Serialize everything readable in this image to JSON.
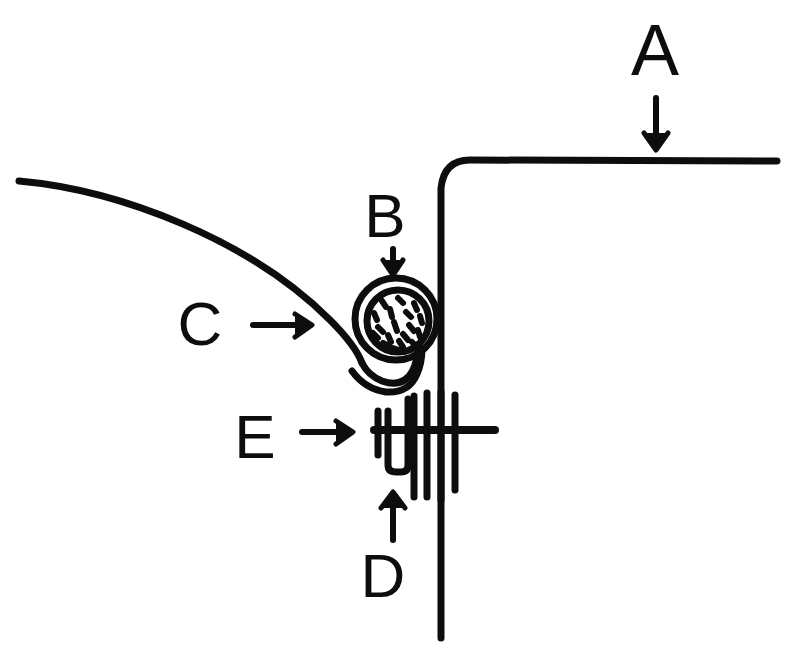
{
  "figure": {
    "background_color": "#ffffff",
    "ink_color": "#0d0d0d",
    "width": 790,
    "height": 659,
    "style": "black-and-white line drawing"
  },
  "labels": [
    {
      "id": "A",
      "text": "A",
      "arrow_direction": "down",
      "points_to": "upper horizontal surface line at right",
      "label_x": 655,
      "label_y": 75,
      "font_size": 72
    },
    {
      "id": "B",
      "text": "B",
      "arrow_direction": "down",
      "points_to": "stippled circular structure",
      "label_x": 385,
      "label_y": 237,
      "font_size": 62
    },
    {
      "id": "C",
      "text": "C",
      "arrow_direction": "right",
      "points_to": "descending curved line from upper left",
      "label_x": 200,
      "label_y": 345,
      "font_size": 62
    },
    {
      "id": "D",
      "text": "D",
      "arrow_direction": "up",
      "points_to": "vertical strand bundle",
      "label_x": 383,
      "label_y": 597,
      "font_size": 62
    },
    {
      "id": "E",
      "text": "E",
      "arrow_direction": "right",
      "points_to": "horizontal crossbar element",
      "label_x": 255,
      "label_y": 458,
      "font_size": 62
    }
  ],
  "drawing_parts": [
    {
      "name": "upper-horizontal-line",
      "description": "Long horizontal line running right from a rounded corner"
    },
    {
      "name": "vertical-wall-line",
      "description": "Long vertical line descending from the rounded corner to the bottom"
    },
    {
      "name": "left-descending-curve",
      "description": "Curve sweeping from the upper left down toward the centre"
    },
    {
      "name": "stippled-circle",
      "description": "Double-ringed circle with short dashes inside",
      "dash_count": 18
    },
    {
      "name": "double-line-loop",
      "description": "Paired lines curving down from the circle into a U turn"
    },
    {
      "name": "crossbar",
      "description": "Horizontal bar with a short vertical cap at its left end"
    },
    {
      "name": "strand-bundle",
      "description": "Group of parallel vertical strands hanging below the crossbar",
      "strand_count": 4
    }
  ]
}
